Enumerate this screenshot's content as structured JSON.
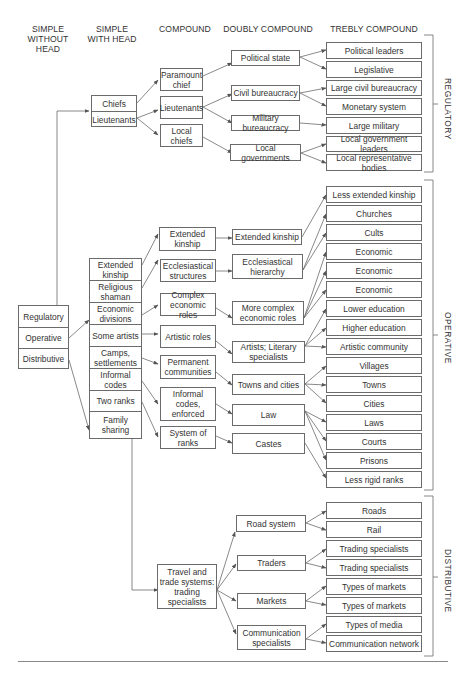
{
  "headers": {
    "col1": "SIMPLE WITHOUT HEAD",
    "col2": "SIMPLE WITH HEAD",
    "col3": "COMPOUND",
    "col4": "DOUBLY COMPOUND",
    "col5": "TREBLY COMPOUND"
  },
  "simple_without_head": [
    "Regulatory",
    "Operative",
    "Distributive"
  ],
  "simple_with_head": {
    "regulatory": [
      "Chiefs",
      "Lieutenants"
    ],
    "operative": [
      "Extended kinship",
      "Religious shaman",
      "Economic divisions",
      "Some artists",
      "Camps, settlements",
      "Informal codes",
      "Two ranks",
      "Family sharing"
    ]
  },
  "compound": {
    "regulatory": [
      "Paramount chief",
      "Lieutenants",
      "Local chiefs"
    ],
    "operative": [
      "Extended kinship",
      "Ecclesiastical structures",
      "Complex economic roles",
      "Artistic roles",
      "Permanent communities",
      "Informal codes, enforced",
      "System of ranks"
    ],
    "distributive": [
      "Travel and trade systems: trading specialists"
    ]
  },
  "doubly_compound": {
    "regulatory": [
      "Political state",
      "Civil bureaucracy",
      "Military bureaucracy",
      "Local governments"
    ],
    "operative": [
      "Extended kinship",
      "Ecclesiastical hierarchy",
      "More complex economic roles",
      "Artists; Literary specialists",
      "Towns and cities",
      "Law",
      "Castes"
    ],
    "distributive": [
      "Road system",
      "Traders",
      "Markets",
      "Communication specialists"
    ]
  },
  "trebly_compound": {
    "regulatory": [
      "Political leaders",
      "Legislative",
      "Large civil bureaucracy",
      "Monetary system",
      "Large military",
      "Local government leaders",
      "Local representative bodies"
    ],
    "operative": [
      "Less extended kinship",
      "Churches",
      "Cults",
      "Economic",
      "Economic",
      "Economic",
      "Lower education",
      "Higher education",
      "Artistic community",
      "Villages",
      "Towns",
      "Cities",
      "Laws",
      "Courts",
      "Prisons",
      "Less rigid ranks"
    ],
    "distributive": [
      "Roads",
      "Rail",
      "Trading specialists",
      "Trading specialists",
      "Types of markets",
      "Types of markets",
      "Types of media",
      "Communication network"
    ]
  },
  "brackets": {
    "regulatory": "REGULATORY",
    "operative": "OPERATIVE",
    "distributive": "DISTRIBUTIVE"
  },
  "colors": {
    "line": "#6b6b6b",
    "text": "#333333",
    "background": "#ffffff"
  }
}
